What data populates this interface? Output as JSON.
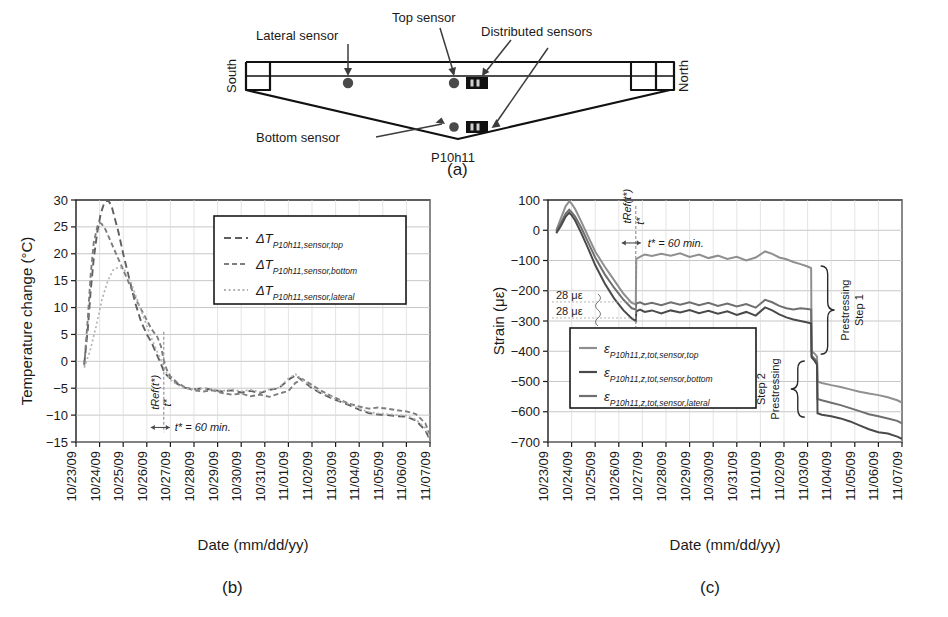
{
  "figure": {
    "panels": [
      {
        "id": "a",
        "label": "(a)"
      },
      {
        "id": "b",
        "label": "(b)"
      },
      {
        "id": "c",
        "label": "(c)"
      }
    ]
  },
  "panel_a": {
    "label": "(a)",
    "girder_name": "P10h11",
    "orientation_left": "South",
    "orientation_right": "North",
    "annotations": [
      {
        "name": "lateral-sensor",
        "text": "Lateral sensor"
      },
      {
        "name": "top-sensor",
        "text": "Top sensor"
      },
      {
        "name": "distributed-sensors",
        "text": "Distributed sensors"
      },
      {
        "name": "bottom-sensor",
        "text": "Bottom sensor"
      }
    ]
  },
  "chart_data": [
    {
      "id": "b",
      "type": "line",
      "title": "",
      "panel_label": "(b)",
      "xlabel": "Date (mm/dd/yy)",
      "ylabel": "Temperature change (°C)",
      "ylim": [
        -15,
        30
      ],
      "yticks": [
        30,
        25,
        20,
        15,
        10,
        5,
        0,
        -5,
        -10,
        -15
      ],
      "ytick_labels": [
        "30",
        "25",
        "20",
        "15",
        "10",
        "5",
        "0",
        "−5",
        "−10",
        "−15"
      ],
      "grid": true,
      "legend_position": "upper-right",
      "categories": [
        "10/23/09",
        "10/24/09",
        "10/25/09",
        "10/26/09",
        "10/27/09",
        "10/28/09",
        "10/29/09",
        "10/30/09",
        "10/31/09",
        "11/01/09",
        "11/02/09",
        "11/03/09",
        "11/04/09",
        "11/05/09",
        "11/06/09",
        "11/07/09"
      ],
      "annotations": [
        {
          "name": "t-ref-label",
          "text": "tRef(t*)",
          "display": "tRef(t*)"
        },
        {
          "name": "t-star-label",
          "text": "t*"
        },
        {
          "name": "t-star-duration",
          "text": "t* = 60 min."
        }
      ],
      "legend": [
        {
          "name": "legend-top",
          "symbol": "ΔT",
          "sub": "P10h11,sensor,top",
          "dash": "long",
          "color": "#6b6b6b"
        },
        {
          "name": "legend-bottom",
          "symbol": "ΔT",
          "sub": "P10h11,sensor,bottom",
          "dash": "medium",
          "color": "#8a8a8a"
        },
        {
          "name": "legend-lateral",
          "symbol": "ΔT",
          "sub": "P10h11,sensor,lateral",
          "dash": "dotted",
          "color": "#b0b0b0"
        }
      ],
      "series": [
        {
          "name": "ΔT_P10h11,sensor,top",
          "x": [
            0.35,
            0.5,
            0.62,
            0.75,
            0.9,
            1.05,
            1.2,
            1.35,
            1.5,
            1.62,
            1.8,
            2.0,
            2.25,
            2.5,
            2.75,
            3.0,
            3.2,
            3.45,
            3.6,
            3.72,
            3.85,
            4.0,
            4.3,
            4.6,
            5.0,
            5.4,
            5.8,
            6.2,
            6.6,
            7.0,
            7.4,
            7.8,
            8.2,
            8.6,
            9.0,
            9.3,
            9.6,
            10.0,
            10.4,
            10.8,
            11.2,
            11.6,
            12.0,
            12.4,
            12.8,
            13.2,
            13.6,
            14.0,
            14.4,
            14.8,
            15.0
          ],
          "y": [
            -0.5,
            6,
            13,
            19,
            24,
            27.5,
            29.5,
            30,
            29,
            27,
            24,
            20,
            15.5,
            11,
            7.5,
            5,
            3.5,
            1.0,
            -0.5,
            -1.8,
            -2.6,
            -3.2,
            -4.2,
            -4.9,
            -5.2,
            -5.0,
            -5.3,
            -5.6,
            -5.4,
            -5.8,
            -5.5,
            -5.9,
            -5.3,
            -5.0,
            -3.4,
            -2.6,
            -3.6,
            -5.0,
            -6.0,
            -6.8,
            -7.5,
            -8.2,
            -9.0,
            -9.6,
            -9.9,
            -10.0,
            -10.2,
            -10.3,
            -11.0,
            -12.8,
            -14.6
          ]
        },
        {
          "name": "ΔT_P10h11,sensor,bottom",
          "x": [
            0.35,
            0.5,
            0.62,
            0.75,
            0.9,
            1.0,
            1.1,
            1.25,
            1.45,
            1.7,
            2.0,
            2.3,
            2.6,
            2.9,
            3.2,
            3.45,
            3.6,
            3.72,
            3.85,
            4.0,
            4.3,
            4.6,
            5.0,
            5.4,
            5.8,
            6.2,
            6.6,
            7.0,
            7.4,
            7.8,
            8.2,
            8.6,
            9.0,
            9.3,
            9.6,
            10.0,
            10.4,
            10.8,
            11.2,
            11.6,
            12.0,
            12.4,
            12.8,
            13.2,
            13.6,
            14.0,
            14.4,
            14.8,
            15.0
          ],
          "y": [
            -0.8,
            8,
            16,
            22,
            25,
            25.8,
            25.5,
            24.5,
            22.5,
            20,
            17,
            14,
            11,
            8.5,
            6.0,
            4.5,
            2.8,
            0.2,
            -1.6,
            -2.8,
            -4.0,
            -4.8,
            -5.4,
            -5.6,
            -5.4,
            -5.9,
            -6.2,
            -6.0,
            -6.5,
            -6.2,
            -6.6,
            -6.0,
            -5.5,
            -4.0,
            -3.3,
            -4.4,
            -5.5,
            -6.4,
            -7.2,
            -7.9,
            -8.4,
            -8.8,
            -8.6,
            -8.8,
            -9.1,
            -9.3,
            -9.8,
            -11.5,
            -13.6
          ]
        },
        {
          "name": "ΔT_P10h11,sensor,lateral",
          "x": [
            0.35,
            0.6,
            0.85,
            1.1,
            1.35,
            1.6,
            1.85,
            2.05,
            2.3,
            2.55,
            2.8,
            3.05,
            3.3,
            3.5,
            3.65,
            3.78,
            3.9,
            4.05,
            4.3,
            4.6,
            5.0,
            5.4,
            5.8,
            6.2,
            6.6,
            7.0,
            7.4,
            7.8,
            8.2,
            8.6,
            9.0,
            9.3,
            9.6,
            10.0,
            10.4,
            10.8,
            11.2,
            11.6,
            12.0,
            12.4,
            12.8,
            13.2,
            13.6,
            14.0,
            14.4,
            14.8,
            15.0
          ],
          "y": [
            -1.2,
            2.0,
            6.5,
            11.5,
            15.0,
            17.2,
            17.5,
            17.0,
            15.0,
            12.0,
            9.0,
            6.0,
            3.2,
            1.2,
            -0.2,
            -1.6,
            -2.8,
            -3.6,
            -4.4,
            -5.0,
            -5.2,
            -5.0,
            -5.2,
            -5.5,
            -5.2,
            -5.6,
            -5.3,
            -5.7,
            -5.2,
            -4.9,
            -3.2,
            -2.4,
            -3.5,
            -4.8,
            -5.8,
            -6.6,
            -7.4,
            -8.0,
            -8.8,
            -9.4,
            -9.7,
            -9.8,
            -10.0,
            -10.1,
            -10.8,
            -12.4,
            -14.2
          ]
        }
      ]
    },
    {
      "id": "c",
      "type": "line",
      "title": "",
      "panel_label": "(c)",
      "xlabel": "Date (mm/dd/yy)",
      "ylabel": "Strain (με)",
      "ylim": [
        -700,
        100
      ],
      "yticks": [
        100,
        0,
        -100,
        -200,
        -300,
        -400,
        -500,
        -600,
        -700
      ],
      "ytick_labels": [
        "100",
        "0",
        "−100",
        "−200",
        "−300",
        "−400",
        "−500",
        "−600",
        "−700"
      ],
      "grid": true,
      "legend_position": "lower-left",
      "categories": [
        "10/23/09",
        "10/24/09",
        "10/25/09",
        "10/26/09",
        "10/27/09",
        "10/28/09",
        "10/29/09",
        "10/30/09",
        "10/31/09",
        "11/01/09",
        "11/02/09",
        "11/03/09",
        "11/04/09",
        "11/05/09",
        "11/06/09",
        "11/07/09"
      ],
      "annotations": [
        {
          "name": "t-ref-label",
          "text": "tRef(t*)"
        },
        {
          "name": "t-star-label",
          "text": "t*"
        },
        {
          "name": "t-star-duration",
          "text": "t* = 60 min."
        },
        {
          "name": "offset-upper",
          "text": "28 με"
        },
        {
          "name": "offset-lower",
          "text": "28 με"
        },
        {
          "name": "prestressing-step-1",
          "text": "Prestressing\nStep 1",
          "line1": "Prestressing",
          "line2": "Step 1"
        },
        {
          "name": "prestressing-step-2",
          "text": "Prestressing\nStep 2",
          "line1": "Prestressing",
          "line2": "Step 2"
        }
      ],
      "legend": [
        {
          "name": "legend-top",
          "symbol": "ε",
          "sub": "P10h11,z,tot,sensor,top",
          "color": "#8a8a8a"
        },
        {
          "name": "legend-bottom",
          "symbol": "ε",
          "sub": "P10h11,z,tot,sensor,bottom",
          "color": "#555555"
        },
        {
          "name": "legend-lateral",
          "symbol": "ε",
          "sub": "P10h11,z,tot,sensor,lateral",
          "color": "#6e6e6e"
        }
      ],
      "series": [
        {
          "name": "ε_P10h11,z,tot,sensor,top",
          "x": [
            0.35,
            0.55,
            0.75,
            0.9,
            1.0,
            1.15,
            1.4,
            1.7,
            2.0,
            2.4,
            2.8,
            3.2,
            3.55,
            3.72,
            3.74,
            3.9,
            4.1,
            4.4,
            4.8,
            5.2,
            5.6,
            6.0,
            6.4,
            6.8,
            7.2,
            7.6,
            8.0,
            8.4,
            8.8,
            9.2,
            9.5,
            9.8,
            10.1,
            10.4,
            10.7,
            11.0,
            11.15,
            11.17,
            11.3,
            11.4,
            11.42,
            11.6,
            12.0,
            12.4,
            12.8,
            13.2,
            13.6,
            14.0,
            14.4,
            14.8,
            15.0
          ],
          "y": [
            0,
            40,
            80,
            95,
            88,
            70,
            30,
            -20,
            -70,
            -120,
            -165,
            -210,
            -240,
            -245,
            -95,
            -88,
            -80,
            -85,
            -78,
            -84,
            -76,
            -88,
            -80,
            -92,
            -84,
            -95,
            -88,
            -100,
            -90,
            -70,
            -78,
            -90,
            -96,
            -105,
            -112,
            -120,
            -125,
            -400,
            -408,
            -418,
            -500,
            -505,
            -512,
            -518,
            -526,
            -534,
            -540,
            -545,
            -552,
            -562,
            -570
          ]
        },
        {
          "name": "ε_P10h11,z,tot,sensor,lateral",
          "x": [
            0.35,
            0.55,
            0.75,
            0.9,
            1.0,
            1.15,
            1.4,
            1.7,
            2.0,
            2.4,
            2.8,
            3.2,
            3.55,
            3.72,
            3.74,
            3.9,
            4.1,
            4.4,
            4.8,
            5.2,
            5.6,
            6.0,
            6.4,
            6.8,
            7.2,
            7.6,
            8.0,
            8.4,
            8.8,
            9.2,
            9.5,
            9.8,
            10.1,
            10.4,
            10.7,
            11.0,
            11.15,
            11.17,
            11.3,
            11.4,
            11.42,
            11.6,
            12.0,
            12.4,
            12.8,
            13.2,
            13.6,
            14.0,
            14.4,
            14.8,
            15.0
          ],
          "y": [
            -5,
            25,
            55,
            68,
            60,
            45,
            10,
            -40,
            -90,
            -145,
            -190,
            -230,
            -258,
            -262,
            -242,
            -238,
            -245,
            -240,
            -248,
            -238,
            -246,
            -238,
            -248,
            -240,
            -250,
            -242,
            -252,
            -244,
            -256,
            -230,
            -238,
            -250,
            -258,
            -262,
            -258,
            -260,
            -262,
            -415,
            -425,
            -435,
            -558,
            -562,
            -570,
            -578,
            -588,
            -598,
            -608,
            -615,
            -622,
            -630,
            -638
          ]
        },
        {
          "name": "ε_P10h11,z,tot,sensor,bottom",
          "x": [
            0.35,
            0.55,
            0.75,
            0.9,
            1.0,
            1.15,
            1.4,
            1.7,
            2.0,
            2.4,
            2.8,
            3.2,
            3.55,
            3.72,
            3.74,
            3.9,
            4.1,
            4.4,
            4.8,
            5.2,
            5.6,
            6.0,
            6.4,
            6.8,
            7.2,
            7.6,
            8.0,
            8.4,
            8.8,
            9.2,
            9.5,
            9.8,
            10.1,
            10.4,
            10.7,
            11.0,
            11.15,
            11.17,
            11.3,
            11.4,
            11.42,
            11.6,
            12.0,
            12.4,
            12.8,
            13.2,
            13.6,
            14.0,
            14.4,
            14.8,
            15.0
          ],
          "y": [
            -10,
            15,
            45,
            58,
            50,
            32,
            -8,
            -60,
            -115,
            -175,
            -225,
            -265,
            -292,
            -300,
            -268,
            -262,
            -270,
            -265,
            -275,
            -265,
            -272,
            -264,
            -274,
            -266,
            -276,
            -268,
            -280,
            -270,
            -282,
            -255,
            -265,
            -278,
            -288,
            -295,
            -300,
            -305,
            -308,
            -420,
            -432,
            -445,
            -605,
            -610,
            -615,
            -622,
            -632,
            -645,
            -658,
            -668,
            -672,
            -682,
            -690
          ]
        }
      ]
    }
  ]
}
